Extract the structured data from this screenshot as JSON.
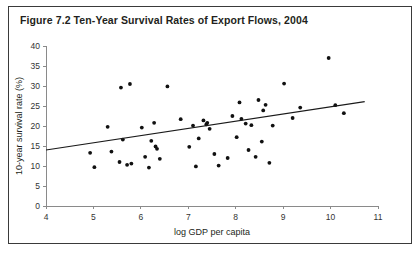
{
  "figure": {
    "title": "Figure 7.2  Ten-Year Survival Rates of Export Flows, 2004",
    "border_color": "#3a3a3a",
    "background": "#ffffff"
  },
  "chart_data": {
    "type": "scatter",
    "title": "Figure 7.2  Ten-Year Survival Rates of Export Flows, 2004",
    "xlabel": "log GDP per capita",
    "ylabel": "10-year survival rate (%)",
    "xlim": [
      4,
      11
    ],
    "ylim": [
      0,
      40
    ],
    "xticks": [
      4,
      5,
      6,
      7,
      8,
      9,
      10,
      11
    ],
    "yticks": [
      0,
      5,
      10,
      15,
      20,
      25,
      30,
      35,
      40
    ],
    "xtick_labels": [
      "4",
      "5",
      "6",
      "7",
      "8",
      "9",
      "10",
      "11"
    ],
    "ytick_labels": [
      "0",
      "5",
      "10",
      "15",
      "20",
      "25",
      "30",
      "35",
      "40"
    ],
    "grid": false,
    "legend": null,
    "marker_color": "#111111",
    "marker_size": 1.9,
    "points": [
      [
        4.93,
        13.3
      ],
      [
        5.02,
        9.7
      ],
      [
        5.3,
        19.8
      ],
      [
        5.38,
        13.6
      ],
      [
        5.55,
        11.0
      ],
      [
        5.58,
        29.6
      ],
      [
        5.62,
        16.6
      ],
      [
        5.71,
        10.3
      ],
      [
        5.77,
        30.5
      ],
      [
        5.8,
        10.6
      ],
      [
        6.02,
        19.6
      ],
      [
        6.09,
        12.3
      ],
      [
        6.17,
        9.6
      ],
      [
        6.22,
        16.3
      ],
      [
        6.28,
        20.8
      ],
      [
        6.31,
        14.9
      ],
      [
        6.34,
        14.3
      ],
      [
        6.4,
        11.8
      ],
      [
        6.56,
        29.9
      ],
      [
        6.84,
        21.7
      ],
      [
        7.02,
        14.8
      ],
      [
        7.1,
        20.1
      ],
      [
        7.16,
        9.9
      ],
      [
        7.22,
        16.9
      ],
      [
        7.32,
        21.4
      ],
      [
        7.38,
        20.4
      ],
      [
        7.4,
        20.8
      ],
      [
        7.45,
        19.3
      ],
      [
        7.55,
        13.0
      ],
      [
        7.64,
        10.1
      ],
      [
        7.83,
        12.0
      ],
      [
        7.93,
        22.5
      ],
      [
        8.02,
        17.2
      ],
      [
        8.08,
        25.9
      ],
      [
        8.12,
        21.8
      ],
      [
        8.21,
        20.6
      ],
      [
        8.27,
        14.0
      ],
      [
        8.33,
        20.2
      ],
      [
        8.42,
        12.3
      ],
      [
        8.48,
        26.5
      ],
      [
        8.55,
        16.1
      ],
      [
        8.58,
        23.9
      ],
      [
        8.63,
        25.3
      ],
      [
        8.71,
        10.8
      ],
      [
        8.78,
        20.1
      ],
      [
        9.02,
        30.6
      ],
      [
        9.2,
        22.0
      ],
      [
        9.36,
        24.6
      ],
      [
        9.96,
        37.0
      ],
      [
        10.1,
        25.2
      ],
      [
        10.28,
        23.2
      ]
    ],
    "trend_line": {
      "label": "fitted regression line",
      "x_start": 4.0,
      "y_start": 14.0,
      "x_end": 10.72,
      "y_end": 26.1,
      "color": "#1a1a1a"
    }
  }
}
